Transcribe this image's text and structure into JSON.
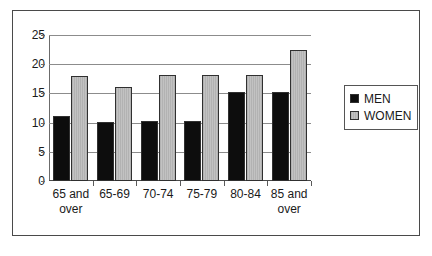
{
  "chart_data": {
    "type": "bar",
    "title": "",
    "xlabel": "",
    "ylabel": "",
    "categories": [
      "65 and over",
      "65-69",
      "70-74",
      "75-79",
      "80-84",
      "85 and over"
    ],
    "series": [
      {
        "name": "MEN",
        "color": "#0d0d0d",
        "values": [
          11.1,
          10.1,
          10.2,
          10.2,
          15.2,
          15.2
        ]
      },
      {
        "name": "WOMEN",
        "color": "#b9b9b9",
        "values": [
          18.0,
          16.1,
          18.2,
          18.2,
          18.2,
          22.4
        ]
      }
    ],
    "ylim": [
      0,
      25
    ],
    "yticks": [
      0,
      5,
      10,
      15,
      20,
      25
    ],
    "ytick_labels": [
      "0",
      "5",
      "10",
      "15",
      "20",
      "25"
    ],
    "grid": true,
    "grid_axis": "y",
    "legend_position": "right"
  },
  "legend": {
    "items": [
      {
        "label": "MEN"
      },
      {
        "label": "WOMEN"
      }
    ]
  },
  "caption": {
    "text": ""
  }
}
